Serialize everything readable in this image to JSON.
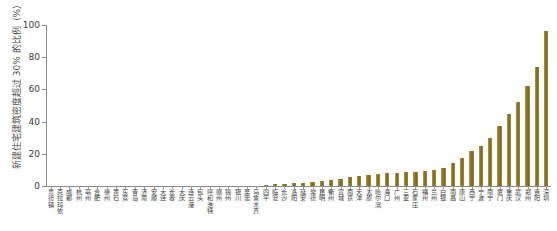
{
  "chart_data": {
    "type": "bar",
    "title": "",
    "xlabel": "",
    "ylabel": "新建住宅建筑密度超过 30% 的比例（%）",
    "ylim": [
      0,
      100
    ],
    "yticks": [
      0,
      20,
      40,
      60,
      80,
      100
    ],
    "grid": false,
    "legend": null,
    "bar_color": "#8d7529",
    "categories": [
      "景德镇",
      "克拉玛依",
      "成都",
      "杭州",
      "亳州",
      "合肥",
      "徐州",
      "黄石",
      "东营",
      "青岛",
      "济南",
      "安顺",
      "大连",
      "长春",
      "大庆",
      "连云港",
      "包头",
      "呼和浩特",
      "赣州",
      "锦州",
      "银川",
      "吴忠",
      "乌鲁木齐",
      "四平",
      "临沧",
      "长沙",
      "洛阳",
      "延安",
      "常德",
      "昆明",
      "衢州",
      "宣城",
      "南京",
      "天津",
      "太原",
      "哈尔滨",
      "海口",
      "广州",
      "三亚",
      "石家庄",
      "福州",
      "兰州",
      "白银",
      "南昌",
      "唐山",
      "西宁",
      "宁波",
      "南宁",
      "厦门",
      "重庆",
      "武汉",
      "郑州",
      "贵阳",
      "深圳"
    ],
    "values": [
      0.0,
      0.0,
      0.0,
      0.0,
      0.0,
      0.0,
      0.0,
      0.0,
      0.0,
      0.0,
      0.0,
      0.0,
      0.0,
      0.0,
      0.0,
      0.0,
      0.0,
      0.0,
      0.0,
      0.0,
      0.0,
      0.0,
      0.0,
      0.6,
      1.0,
      1.3,
      1.6,
      2.0,
      2.6,
      3.2,
      4.0,
      4.6,
      5.3,
      6.0,
      6.6,
      7.2,
      7.8,
      8.2,
      8.6,
      9.0,
      9.4,
      10.0,
      11.5,
      14.0,
      17.5,
      22.0,
      25.0,
      30.0,
      37.0,
      45.0,
      52.0,
      62.0,
      74.0,
      96.0
    ]
  }
}
